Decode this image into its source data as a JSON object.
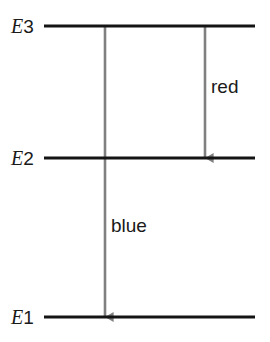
{
  "diagram": {
    "type": "energy-level-diagram",
    "title": "",
    "background_color": "#ffffff",
    "level_line_color": "#141414",
    "arrow_color": "#808080",
    "text_color": "#1a1a1a",
    "levels": [
      {
        "id": "E3",
        "symbol": "E",
        "index": "3",
        "label": "E3",
        "y": 26,
        "x_start": 44,
        "x_end": 255
      },
      {
        "id": "E2",
        "symbol": "E",
        "index": "2",
        "label": "E2",
        "y": 158,
        "x_start": 44,
        "x_end": 255
      },
      {
        "id": "E1",
        "symbol": "E",
        "index": "1",
        "label": "E1",
        "y": 317,
        "x_start": 44,
        "x_end": 255
      }
    ],
    "transitions": [
      {
        "id": "red-transition",
        "label": "red",
        "from_level": "E3",
        "to_level": "E2",
        "x": 205,
        "y_start": 26,
        "y_end": 158,
        "label_x": 211,
        "label_y": 77
      },
      {
        "id": "blue-transition",
        "label": "blue",
        "from_level": "E3",
        "to_level": "E1",
        "x": 105,
        "y_start": 26,
        "y_end": 317,
        "label_x": 111,
        "label_y": 216
      }
    ]
  }
}
